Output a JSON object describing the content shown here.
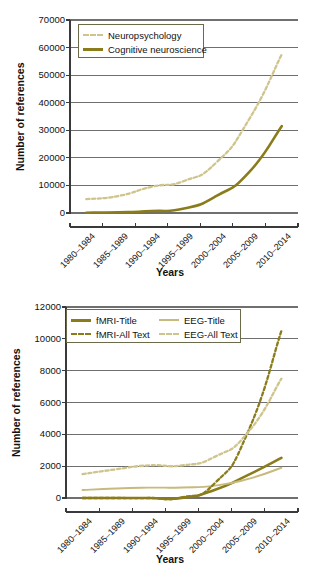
{
  "figure": {
    "background": "#ffffff",
    "colors": {
      "dark_olive": "#8a7c1b",
      "light_olive": "#c6ba7d",
      "dash_light_olive": "#cfc48c",
      "gridline": "#6f6f6f",
      "axis": "#3a3a3a",
      "text": "#111111"
    }
  },
  "chart_data": [
    {
      "id": "top",
      "type": "line",
      "title": "",
      "xlabel": "Years",
      "ylabel": "Number of references",
      "ylim": [
        0,
        70000
      ],
      "ytick_step": 10000,
      "yticks": [
        "0",
        "10000",
        "20000",
        "30000",
        "40000",
        "50000",
        "60000",
        "70000"
      ],
      "grid": "horizontal",
      "legend_position": "top-left-inside",
      "categories": [
        "1980–1984",
        "1985–1989",
        "1990–1994",
        "1995–1999",
        "2000–2004",
        "2005–2009",
        "2010–2014"
      ],
      "series": [
        {
          "name": "Neuropsychology",
          "style": "dashed",
          "color": "#cfc48c",
          "values": [
            5000,
            6200,
            9500,
            11600,
            18400,
            34000,
            57500
          ]
        },
        {
          "name": "Cognitive neuroscience",
          "style": "solid",
          "color": "#8a7c1b",
          "values": [
            100,
            250,
            700,
            1600,
            6200,
            14800,
            31500
          ]
        }
      ]
    },
    {
      "id": "bottom",
      "type": "line",
      "title": "",
      "xlabel": "Years",
      "ylabel": "Number of references",
      "ylim": [
        0,
        12000
      ],
      "ytick_step": 2000,
      "yticks": [
        "0",
        "2000",
        "4000",
        "6000",
        "8000",
        "10000",
        "12000"
      ],
      "grid": "horizontal",
      "legend_position": "top-left-inside",
      "categories": [
        "1980–1984",
        "1985–1989",
        "1990–1994",
        "1995–1999",
        "2000–2004",
        "2005–2009",
        "2010–2014"
      ],
      "series": [
        {
          "name": "fMRI-Title",
          "style": "solid",
          "color": "#8a7c1b",
          "values": [
            0,
            0,
            0,
            10,
            520,
            1450,
            2520
          ]
        },
        {
          "name": "EEG-Title",
          "style": "solid",
          "color": "#c6ba7d",
          "values": [
            500,
            600,
            650,
            660,
            780,
            1200,
            1900
          ]
        },
        {
          "name": "fMRI-All Text",
          "style": "dashed",
          "color": "#8a7c1b",
          "values": [
            0,
            0,
            0,
            40,
            950,
            4200,
            10500
          ]
        },
        {
          "name": "EEG-All Text",
          "style": "dashed",
          "color": "#cfc48c",
          "values": [
            1500,
            1800,
            2050,
            2050,
            2600,
            4150,
            7500
          ]
        }
      ]
    }
  ]
}
